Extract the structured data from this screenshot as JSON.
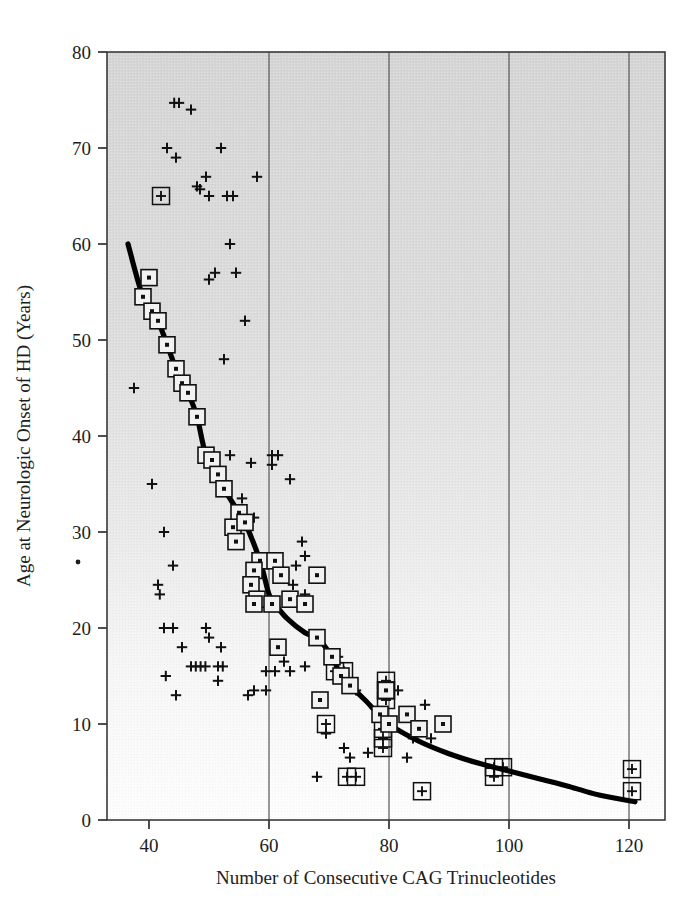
{
  "chart_data": {
    "type": "scatter",
    "title": "",
    "xlabel": "Number of Consecutive  CAG Trinucleotides",
    "ylabel": "Age at Neurologic Onset of HD (Years)",
    "xlim": [
      33,
      126
    ],
    "ylim": [
      0,
      80
    ],
    "xticks": [
      40,
      60,
      80,
      100,
      120
    ],
    "yticks": [
      0,
      10,
      20,
      30,
      40,
      50,
      60,
      70,
      80
    ],
    "xtick_labels": [
      "40",
      "60",
      "80",
      "100",
      "120"
    ],
    "ytick_labels": [
      "0",
      "10",
      "20",
      "30",
      "40",
      "50",
      "60",
      "70",
      "80"
    ],
    "gridlines_x": [
      60,
      80,
      100,
      120
    ],
    "grid": "vertical-only",
    "legend": "none",
    "plot_background": "#d8d8d8-to-#fbfbfb vertical gradient",
    "series": [
      {
        "name": "Individual patients (plus markers)",
        "marker": "plus",
        "points": [
          [
            44.2,
            74.7
          ],
          [
            45.0,
            74.7
          ],
          [
            47.0,
            74.0
          ],
          [
            43.0,
            70.0
          ],
          [
            52.0,
            70.0
          ],
          [
            44.5,
            69.0
          ],
          [
            49.5,
            67.0
          ],
          [
            58.0,
            67.0
          ],
          [
            48.0,
            66.0
          ],
          [
            50.0,
            65.0
          ],
          [
            53.0,
            65.0
          ],
          [
            54.0,
            65.0
          ],
          [
            48.5,
            65.7
          ],
          [
            53.5,
            60.0
          ],
          [
            51.0,
            57.0
          ],
          [
            54.5,
            57.0
          ],
          [
            50.0,
            56.3
          ],
          [
            56.0,
            52.0
          ],
          [
            52.5,
            48.0
          ],
          [
            37.5,
            45.0
          ],
          [
            53.5,
            38.0
          ],
          [
            60.5,
            38.0
          ],
          [
            61.5,
            38.0
          ],
          [
            57.0,
            37.2
          ],
          [
            60.5,
            37.0
          ],
          [
            40.5,
            35.0
          ],
          [
            63.5,
            35.5
          ],
          [
            42.5,
            30.0
          ],
          [
            55.5,
            33.5
          ],
          [
            57.5,
            31.5
          ],
          [
            65.5,
            29.0
          ],
          [
            66.0,
            27.5
          ],
          [
            44.0,
            26.5
          ],
          [
            64.5,
            26.5
          ],
          [
            68.5,
            25.5
          ],
          [
            41.5,
            24.5
          ],
          [
            41.8,
            23.5
          ],
          [
            64.0,
            24.5
          ],
          [
            66.0,
            23.5
          ],
          [
            42.5,
            20.0
          ],
          [
            44.0,
            20.0
          ],
          [
            49.5,
            20.0
          ],
          [
            50.0,
            19.0
          ],
          [
            45.5,
            18.0
          ],
          [
            52.0,
            18.0
          ],
          [
            47.0,
            16.0
          ],
          [
            47.8,
            16.0
          ],
          [
            48.6,
            16.0
          ],
          [
            49.4,
            16.0
          ],
          [
            51.5,
            16.0
          ],
          [
            52.3,
            16.0
          ],
          [
            42.8,
            15.0
          ],
          [
            59.5,
            15.5
          ],
          [
            61.0,
            15.5
          ],
          [
            63.5,
            15.5
          ],
          [
            62.5,
            16.5
          ],
          [
            66.0,
            16.0
          ],
          [
            71.5,
            17.0
          ],
          [
            51.5,
            14.5
          ],
          [
            44.5,
            13.0
          ],
          [
            56.5,
            13.0
          ],
          [
            57.5,
            13.5
          ],
          [
            59.5,
            13.5
          ],
          [
            73.0,
            14.5
          ],
          [
            74.5,
            13.5
          ],
          [
            69.5,
            9.0
          ],
          [
            72.5,
            7.5
          ],
          [
            73.5,
            6.5
          ],
          [
            76.5,
            7.0
          ],
          [
            68.0,
            4.5
          ],
          [
            78.5,
            11.0
          ],
          [
            81.5,
            13.5
          ],
          [
            86.0,
            12.0
          ],
          [
            84.0,
            8.5
          ],
          [
            87.0,
            8.5
          ],
          [
            83.0,
            6.5
          ]
        ]
      },
      {
        "name": "Patients on regression line (boxed dot markers)",
        "marker": "boxed-dot",
        "points": [
          [
            40.0,
            56.5
          ],
          [
            39.0,
            54.5
          ],
          [
            40.5,
            53.0
          ],
          [
            41.5,
            52.0
          ],
          [
            43.0,
            49.5
          ],
          [
            44.5,
            47.0
          ],
          [
            45.5,
            45.5
          ],
          [
            46.5,
            44.5
          ],
          [
            48.0,
            42.0
          ],
          [
            49.5,
            38.0
          ],
          [
            50.5,
            37.5
          ],
          [
            51.5,
            36.0
          ],
          [
            52.5,
            34.5
          ],
          [
            55.0,
            32.0
          ],
          [
            54.0,
            30.5
          ],
          [
            56.0,
            31.0
          ],
          [
            54.5,
            29.0
          ],
          [
            58.5,
            27.0
          ],
          [
            61.0,
            27.0
          ],
          [
            57.5,
            26.0
          ],
          [
            62.0,
            25.5
          ],
          [
            68.0,
            25.5
          ],
          [
            57.0,
            24.5
          ],
          [
            58.0,
            23.0
          ],
          [
            57.5,
            22.5
          ],
          [
            60.5,
            22.5
          ],
          [
            63.5,
            23.0
          ],
          [
            66.0,
            22.5
          ],
          [
            61.5,
            18.0
          ],
          [
            68.0,
            19.0
          ],
          [
            70.5,
            17.0
          ],
          [
            72.0,
            15.0
          ],
          [
            73.5,
            14.0
          ],
          [
            68.5,
            12.5
          ],
          [
            78.5,
            11.0
          ],
          [
            80.0,
            10.0
          ],
          [
            83.0,
            11.0
          ],
          [
            85.0,
            9.5
          ],
          [
            89.0,
            10.0
          ],
          [
            79.5,
            13.5
          ]
        ]
      },
      {
        "name": "Patients (boxed plus markers)",
        "marker": "boxed-plus",
        "points": [
          [
            42.0,
            65.0
          ],
          [
            71.0,
            15.5
          ],
          [
            72.5,
            15.5
          ],
          [
            79.5,
            14.5
          ],
          [
            79.5,
            13.5
          ],
          [
            79.5,
            12.5
          ],
          [
            69.5,
            10.0
          ],
          [
            79.0,
            9.5
          ],
          [
            79.0,
            8.5
          ],
          [
            79.0,
            7.5
          ],
          [
            73.0,
            4.5
          ],
          [
            74.5,
            4.5
          ],
          [
            85.5,
            3.0
          ],
          [
            97.5,
            5.5
          ],
          [
            99.0,
            5.5
          ],
          [
            97.5,
            4.5
          ],
          [
            120.5,
            5.3
          ],
          [
            120.5,
            3.0
          ]
        ]
      }
    ],
    "regression_curve": {
      "name": "Fitted exponential decline",
      "description": "Thick black curve of best fit showing age at onset declining with CAG repeat length",
      "points": [
        [
          36.5,
          60.0
        ],
        [
          39.0,
          54.5
        ],
        [
          41.5,
          52.0
        ],
        [
          44.5,
          47.0
        ],
        [
          46.5,
          44.5
        ],
        [
          48.0,
          42.0
        ],
        [
          49.5,
          38.0
        ],
        [
          51.5,
          36.0
        ],
        [
          52.5,
          34.5
        ],
        [
          55.0,
          32.0
        ],
        [
          56.0,
          31.0
        ],
        [
          58.5,
          27.0
        ],
        [
          60.0,
          23.5
        ],
        [
          61.0,
          22.5
        ],
        [
          63.0,
          21.0
        ],
        [
          66.0,
          19.5
        ],
        [
          68.0,
          19.0
        ],
        [
          70.5,
          17.0
        ],
        [
          72.0,
          15.0
        ],
        [
          73.5,
          14.0
        ],
        [
          76.0,
          12.5
        ],
        [
          80.0,
          10.0
        ],
        [
          85.0,
          8.2
        ],
        [
          90.0,
          6.9
        ],
        [
          95.0,
          5.9
        ],
        [
          100.0,
          5.1
        ],
        [
          105.0,
          4.3
        ],
        [
          110.0,
          3.5
        ],
        [
          115.0,
          2.6
        ],
        [
          121.0,
          1.9
        ]
      ]
    }
  },
  "figure": {
    "axis_line_color": "#3a3a3a",
    "marker_color": "#111111",
    "curve_color": "#000000"
  }
}
